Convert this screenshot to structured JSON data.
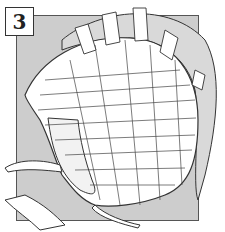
{
  "illustration": {
    "step_number": "3",
    "subject": "helmet covered in overlapping paper strips (papier-mache)",
    "colors": {
      "background": "#ffffff",
      "panel": "#cdcdcd",
      "line": "#333333",
      "paper": "#ffffff",
      "rim_shadow": "#d9d9d9"
    }
  }
}
